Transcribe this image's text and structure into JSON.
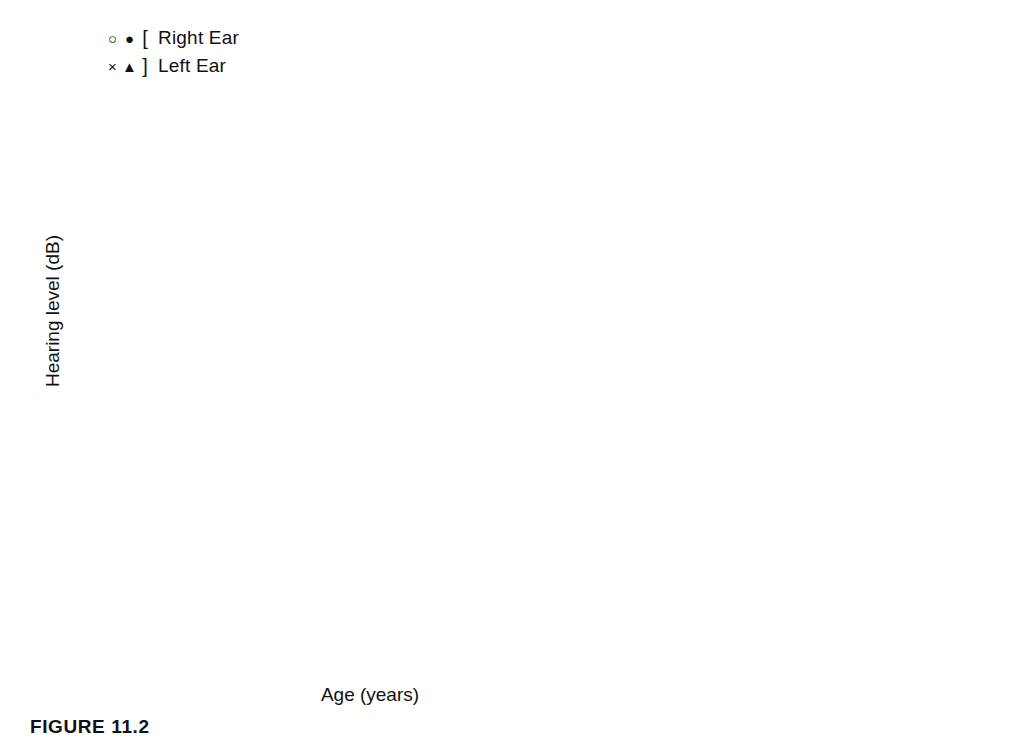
{
  "legend": {
    "rows": [
      {
        "sym_open": "open-circle",
        "sym_filled": "filled-circle",
        "bracket": "[",
        "label": "Right Ear"
      },
      {
        "sym_open": "x-mark",
        "sym_filled": "filled-triangle",
        "bracket": "]",
        "label": "Left Ear"
      }
    ]
  },
  "axes": {
    "ylabel": "Hearing level (dB)",
    "xlabel": "Age (years)",
    "yticks": [
      "0",
      "20",
      "40",
      "60",
      "80",
      "100",
      "120"
    ],
    "xticks": [
      "1.49",
      "5.42"
    ],
    "ylim": [
      0,
      130
    ],
    "xlim": [
      1.49,
      5.42
    ]
  },
  "caption": "FIGURE 11.2",
  "chart_data": {
    "type": "line",
    "title": "FIGURE 11.2",
    "xlabel": "Age (years)",
    "ylabel": "Hearing level (dB)",
    "ylim": [
      0,
      130
    ],
    "y_inverted": true,
    "grid": false,
    "legend_position": "above-top-left",
    "x_tick_labels": [
      "1.49",
      "5.42"
    ],
    "x_tick_values": [
      1.49,
      2.47,
      3.45,
      4.44,
      5.42
    ],
    "y_tick_values": [
      0,
      20,
      40,
      60,
      80,
      100,
      120
    ],
    "series_names": [
      "Right Ear",
      "Left Ear"
    ],
    "panels": [
      {
        "title": "250 Hz",
        "series": [
          {
            "name": "Right Ear",
            "marker": "open-circle",
            "x": [
              1.49,
              3.45,
              5.42
            ],
            "y": [
              41,
              5,
              27
            ]
          },
          {
            "name": "Left Ear",
            "marker": "x-mark",
            "x": [
              3.45,
              5.42
            ],
            "y": [
              12,
              27
            ]
          }
        ]
      },
      {
        "title": "500 Hz",
        "series": [
          {
            "name": "Right Ear",
            "marker": "open-circle",
            "x": [
              1.49,
              2.47,
              3.45,
              5.42
            ],
            "y": [
              42,
              43,
              39,
              53
            ]
          },
          {
            "name": "Left Ear",
            "marker": "x-mark",
            "x": [
              1.49,
              2.47,
              3.45,
              5.42
            ],
            "y": [
              42,
              36,
              39,
              53
            ]
          }
        ]
      },
      {
        "title": "1000 Hz",
        "series": [
          {
            "name": "Right Ear",
            "marker": "open-circle",
            "x": [
              1.49,
              3.45,
              4.44,
              5.42
            ],
            "y": [
              43,
              78,
              74,
              92
            ]
          },
          {
            "name": "Left Ear",
            "marker": "x-mark",
            "x": [
              1.49,
              3.45,
              4.44,
              5.42
            ],
            "y": [
              37,
              68,
              74,
              92
            ]
          }
        ]
      },
      {
        "title": "2000 Hz",
        "series": [
          {
            "name": "Right Ear",
            "marker": "open-circle",
            "x": [
              1.49,
              2.96,
              4.05,
              5.42
            ],
            "y": [
              60,
              70,
              80,
              80
            ]
          },
          {
            "name": "Left Ear",
            "marker": "x-mark",
            "x": [
              1.49,
              2.96,
              4.05,
              5.42
            ],
            "y": [
              44,
              70,
              80,
              90
            ]
          }
        ]
      },
      {
        "title": "4000 Hz",
        "series": [
          {
            "name": "Right Ear",
            "marker": "open-circle",
            "x": [
              1.49,
              2.96,
              3.95,
              5.42
            ],
            "y": [
              61,
              76,
              67,
              87
            ]
          },
          {
            "name": "Left Ear",
            "marker": "x-mark",
            "x": [
              1.49,
              2.96,
              3.95,
              5.42
            ],
            "y": [
              55,
              76,
              70,
              81
            ]
          }
        ]
      },
      {
        "title": "8000 Hz",
        "series": [
          {
            "name": "Right Ear",
            "marker": "open-circle",
            "x": [
              5.42
            ],
            "y": [
              113
            ]
          },
          {
            "name": "Left Ear",
            "marker": "x-mark",
            "x": [
              5.42
            ],
            "y": [
              87
            ]
          }
        ]
      }
    ]
  }
}
